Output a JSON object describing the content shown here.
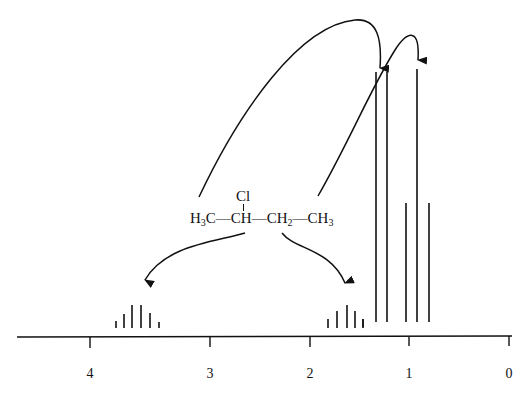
{
  "diagram": {
    "type": "1H NMR spectrum (schematic)",
    "molecule": {
      "substituent": "Cl",
      "groups": [
        {
          "label": "H",
          "sub": "3",
          "tail": "C"
        },
        {
          "label": "CH"
        },
        {
          "label": "CH",
          "sub": "2"
        },
        {
          "label": "CH",
          "sub": "3"
        }
      ],
      "bond": "—"
    },
    "axis": {
      "ticks": [
        {
          "value": "4",
          "x": 90
        },
        {
          "value": "3",
          "x": 210
        },
        {
          "value": "2",
          "x": 310
        },
        {
          "value": "1",
          "x": 409
        },
        {
          "value": "0",
          "x": 509
        }
      ],
      "y": 337,
      "x_start": 17,
      "x_end": 512
    },
    "signals": [
      {
        "group": "CH (Cl)",
        "shift_ppm": 3.6,
        "multiplicity": "sextet",
        "peaks": [
          {
            "x": 116,
            "top": 321
          },
          {
            "x": 124,
            "top": 314
          },
          {
            "x": 132,
            "top": 305
          },
          {
            "x": 141,
            "top": 305
          },
          {
            "x": 150,
            "top": 313
          },
          {
            "x": 159,
            "top": 322
          }
        ]
      },
      {
        "group": "CH2",
        "shift_ppm": 1.7,
        "multiplicity": "pentet",
        "peaks": [
          {
            "x": 328,
            "top": 319
          },
          {
            "x": 337,
            "top": 311
          },
          {
            "x": 347,
            "top": 305
          },
          {
            "x": 355,
            "top": 311
          },
          {
            "x": 363,
            "top": 319
          }
        ]
      },
      {
        "group": "CH3 (on CH)",
        "shift_ppm": 1.35,
        "multiplicity": "doublet",
        "peaks": [
          {
            "x": 376,
            "top": 72
          },
          {
            "x": 387,
            "top": 72
          }
        ]
      },
      {
        "group": "CH3 (on CH2)",
        "shift_ppm": 1.0,
        "multiplicity": "triplet",
        "peaks": [
          {
            "x": 406,
            "top": 203
          },
          {
            "x": 417,
            "top": 69
          },
          {
            "x": 429,
            "top": 203
          }
        ]
      }
    ],
    "baseline_peak_bottom": 328
  }
}
